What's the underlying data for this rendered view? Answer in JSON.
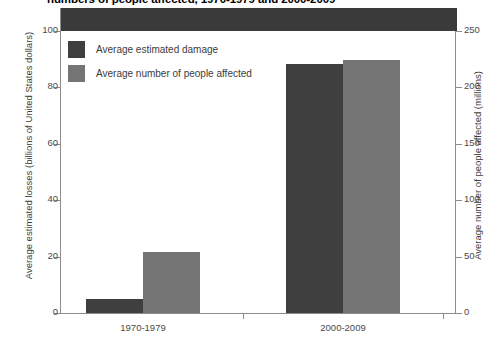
{
  "chart_data": {
    "type": "bar",
    "title": "numbers of people affected, 1970-1979 and 2000-2009",
    "categories": [
      "1970-1979",
      "2000-2009"
    ],
    "series": [
      {
        "name": "Average estimated damage",
        "axis": "left",
        "values": [
          5,
          88
        ],
        "color": "#3f3f3f"
      },
      {
        "name": "Average number of people affected",
        "axis": "right",
        "values": [
          54,
          224
        ],
        "color": "#757575"
      }
    ],
    "left_axis": {
      "label": "Average estimated losses (billions of United States dollars)",
      "ticks": [
        0,
        20,
        40,
        60,
        80,
        100
      ],
      "ylim": [
        0,
        108
      ]
    },
    "right_axis": {
      "label": "Average number of people affected (millions)",
      "ticks": [
        0,
        50,
        100,
        150,
        200,
        250
      ],
      "ylim": [
        0,
        270
      ]
    },
    "grid": false,
    "legend_position": "top-left",
    "xlabel": ""
  },
  "legend": {
    "items": [
      {
        "label": "Average estimated damage"
      },
      {
        "label": "Average number of people affected"
      }
    ]
  }
}
